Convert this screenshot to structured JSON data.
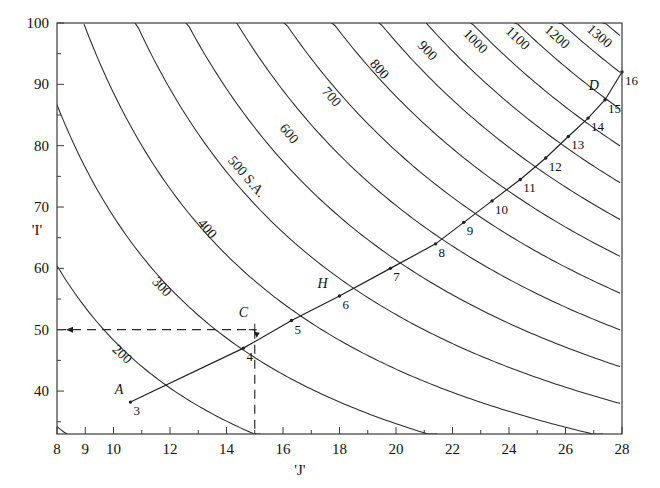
{
  "chart_data": {
    "type": "line",
    "title": "",
    "subtitle": "",
    "xlabel": "'J'",
    "ylabel": "'I'",
    "xlim": [
      8,
      28
    ],
    "ylim": [
      33,
      100
    ],
    "grid": false,
    "legend": "none",
    "x_ticks_major": [
      8,
      10,
      12,
      14,
      16,
      18,
      20,
      22,
      24,
      26,
      28
    ],
    "x_tick_labels": [
      "8",
      "9",
      "10",
      "12",
      "14",
      "16",
      "18",
      "20",
      "22",
      "24",
      "26",
      "28"
    ],
    "x_labeled_values": [
      8,
      9,
      10,
      12,
      14,
      16,
      18,
      20,
      22,
      24,
      26,
      28
    ],
    "x_minor_ticks": [
      9,
      11,
      13,
      15,
      17,
      19,
      21,
      23,
      25,
      27
    ],
    "y_ticks_major": [
      40,
      50,
      60,
      70,
      80,
      90,
      100
    ],
    "y_tick_labels": [
      "40",
      "50",
      "60",
      "70",
      "80",
      "90",
      "100"
    ],
    "y_minor_ticks": [
      35,
      45,
      55,
      65,
      75,
      85,
      95
    ],
    "contours": {
      "description": "family of hyperbolic iso-value curves",
      "levels": [
        200,
        300,
        400,
        500,
        600,
        700,
        800,
        900,
        1000,
        1100,
        1200,
        1300
      ],
      "level_labels": [
        "200",
        "300",
        "400",
        "500 S.A.",
        "600",
        "700",
        "800",
        "900",
        "1000",
        "1100",
        "1200",
        "1300"
      ],
      "unlabeled_levels": [
        100,
        1400,
        1500,
        1600,
        1700,
        1800,
        1900,
        2000,
        2100,
        2200
      ],
      "label_anchors": [
        {
          "level": "200",
          "x": 10.2,
          "y": 45.5
        },
        {
          "level": "300",
          "x": 11.6,
          "y": 56.5
        },
        {
          "level": "400",
          "x": 13.2,
          "y": 66.0
        },
        {
          "level": "500 S.A.",
          "x": 14.6,
          "y": 74.5
        },
        {
          "level": "600",
          "x": 16.1,
          "y": 81.5
        },
        {
          "level": "700",
          "x": 17.6,
          "y": 87.5
        },
        {
          "level": "800",
          "x": 19.3,
          "y": 92.0
        },
        {
          "level": "900",
          "x": 21.0,
          "y": 95.0
        },
        {
          "level": "1000",
          "x": 22.7,
          "y": 96.5
        },
        {
          "level": "1100",
          "x": 24.2,
          "y": 97.0
        },
        {
          "level": "1200",
          "x": 25.6,
          "y": 97.2
        },
        {
          "level": "1300",
          "x": 27.1,
          "y": 97.3
        }
      ]
    },
    "series": [
      {
        "name": "operating-path",
        "type": "polyline-with-markers",
        "points": [
          {
            "label": "3",
            "x": 10.6,
            "y": 38.2
          },
          {
            "label": "4",
            "x": 14.6,
            "y": 47.0
          },
          {
            "label": "5",
            "x": 16.3,
            "y": 51.5
          },
          {
            "label": "6",
            "x": 18.0,
            "y": 55.5
          },
          {
            "label": "7",
            "x": 19.8,
            "y": 60.0
          },
          {
            "label": "8",
            "x": 21.4,
            "y": 64.0
          },
          {
            "label": "9",
            "x": 22.4,
            "y": 67.5
          },
          {
            "label": "10",
            "x": 23.4,
            "y": 71.0
          },
          {
            "label": "11",
            "x": 24.4,
            "y": 74.5
          },
          {
            "label": "12",
            "x": 25.3,
            "y": 78.0
          },
          {
            "label": "13",
            "x": 26.1,
            "y": 81.5
          },
          {
            "label": "14",
            "x": 26.8,
            "y": 84.5
          },
          {
            "label": "15",
            "x": 27.4,
            "y": 87.5
          },
          {
            "label": "16",
            "x": 28.0,
            "y": 92.0
          }
        ]
      }
    ],
    "annotations": [
      {
        "text": "A",
        "x": 10.2,
        "y": 39.6,
        "refers_to": "3"
      },
      {
        "text": "C",
        "x": 14.6,
        "y": 52.0,
        "refers_to": "construction point at J'=15, I'=50"
      },
      {
        "text": "H",
        "x": 17.4,
        "y": 56.8,
        "refers_to": "6"
      },
      {
        "text": "D",
        "x": 27.0,
        "y": 89.0,
        "refers_to": "15"
      }
    ],
    "guide_lines": [
      {
        "name": "horizontal-dashed",
        "style": "dashed",
        "from": [
          8,
          50
        ],
        "to": [
          15,
          50
        ]
      },
      {
        "name": "vertical-dashed",
        "style": "dashed",
        "from": [
          15,
          50
        ],
        "to": [
          15,
          33
        ]
      }
    ]
  },
  "axes": {
    "x_title": "'J'",
    "y_title": "'I'"
  }
}
